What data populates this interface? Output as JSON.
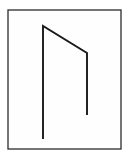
{
  "canvas": {
    "width": 130,
    "height": 159,
    "background_color": "#ffffff"
  },
  "frame": {
    "label": "figure-border",
    "x": 8,
    "y": 10,
    "width": 113,
    "height": 139,
    "stroke_color": "#2b2b2b",
    "stroke_width": 1.3,
    "fill_color": "#fefefe"
  },
  "figure": {
    "label": "open-arch-line-figure",
    "stroke_color": "#1a1a1a",
    "stroke_width": 1.9,
    "polyline_points": "43,139 43,26 87,53 87,115",
    "vertices": [
      {
        "name": "left-line-bottom",
        "x": 43,
        "y": 139
      },
      {
        "name": "apex-top-left",
        "x": 43,
        "y": 26
      },
      {
        "name": "apex-top-right",
        "x": 87,
        "y": 53
      },
      {
        "name": "right-line-bottom",
        "x": 87,
        "y": 115
      }
    ],
    "segments": [
      {
        "name": "left-vertical-segment",
        "from": "left-line-bottom",
        "to": "apex-top-left",
        "length": 113,
        "orientation": "vertical"
      },
      {
        "name": "slanted-top-segment",
        "from": "apex-top-left",
        "to": "apex-top-right",
        "length": 52,
        "orientation": "diagonal"
      },
      {
        "name": "right-vertical-segment",
        "from": "apex-top-right",
        "to": "right-line-bottom",
        "length": 62,
        "orientation": "vertical"
      }
    ]
  }
}
